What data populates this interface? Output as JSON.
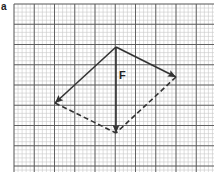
{
  "figure": {
    "panel_label": "a",
    "force_label": "F",
    "grid": {
      "x0": 14,
      "y0": 4,
      "x1": 214,
      "y1": 172,
      "minor": 4.05,
      "major": 20.25,
      "minor_color": "#c8c8c8",
      "major_color": "#555555"
    },
    "vectors": [
      {
        "name": "resultant-F",
        "from": [
          116,
          47
        ],
        "to": [
          116,
          133
        ],
        "style": "solid"
      },
      {
        "name": "component-right",
        "from": [
          116,
          47
        ],
        "to": [
          176,
          77
        ],
        "style": "solid"
      },
      {
        "name": "component-left",
        "from": [
          116,
          47
        ],
        "to": [
          55,
          103
        ],
        "style": "solid"
      }
    ],
    "dashed_lines": [
      {
        "name": "parallelogram-left",
        "from": [
          55,
          103
        ],
        "to": [
          116,
          133
        ]
      },
      {
        "name": "parallelogram-right",
        "from": [
          176,
          77
        ],
        "to": [
          116,
          133
        ]
      }
    ],
    "line_color": "#333333"
  }
}
